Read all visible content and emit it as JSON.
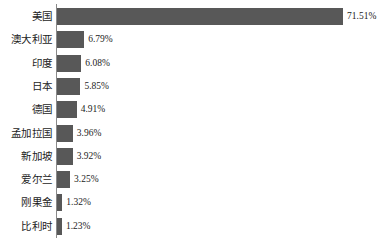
{
  "chart_data": {
    "type": "bar",
    "orientation": "horizontal",
    "title": "",
    "subtitle": "",
    "xlabel": "",
    "ylabel": "",
    "grid": false,
    "legend": null,
    "axis": {
      "category_axis": "y",
      "value_axis": "x",
      "value_range": [
        0,
        71.51
      ],
      "value_unit": "%",
      "tick_labels": [],
      "spine_visible": true
    },
    "value_label_suffix": "%",
    "categories": [
      "美国",
      "澳大利亚",
      "印度",
      "日本",
      "德国",
      "孟加拉国",
      "新加坡",
      "爱尔兰",
      "刚果金",
      "比利时"
    ],
    "values": [
      71.51,
      6.79,
      6.08,
      5.85,
      4.91,
      3.96,
      3.92,
      3.25,
      1.32,
      1.23
    ],
    "value_labels": [
      "71.51%",
      "6.79%",
      "6.08%",
      "5.85%",
      "4.91%",
      "3.96%",
      "3.92%",
      "3.25%",
      "1.32%",
      "1.23%"
    ],
    "bars": [
      {
        "category": "美国",
        "value": 71.51,
        "label": "71.51%"
      },
      {
        "category": "澳大利亚",
        "value": 6.79,
        "label": "6.79%"
      },
      {
        "category": "印度",
        "value": 6.08,
        "label": "6.08%"
      },
      {
        "category": "日本",
        "value": 5.85,
        "label": "5.85%"
      },
      {
        "category": "德国",
        "value": 4.91,
        "label": "4.91%"
      },
      {
        "category": "孟加拉国",
        "value": 3.96,
        "label": "3.96%"
      },
      {
        "category": "新加坡",
        "value": 3.92,
        "label": "3.92%"
      },
      {
        "category": "爱尔兰",
        "value": 3.25,
        "label": "3.25%"
      },
      {
        "category": "刚果金",
        "value": 1.32,
        "label": "1.32%"
      },
      {
        "category": "比利时",
        "value": 1.23,
        "label": "1.23%"
      }
    ],
    "colors": {
      "bar": "#585858",
      "axis": "#8a8a8a",
      "text": "#1c1c1c",
      "background": "#ffffff"
    },
    "layout": {
      "axis_x": 56,
      "bar_start_x": 57,
      "first_bar_top": 8,
      "row_pitch": 23.3,
      "bar_height": 17,
      "px_per_unit": 4.0,
      "value_label_gap": 4
    }
  }
}
